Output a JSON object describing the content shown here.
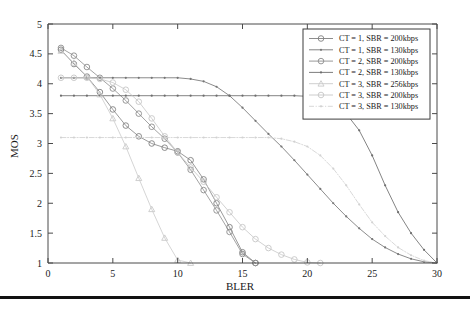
{
  "chart_data": {
    "type": "line",
    "title": "",
    "xlabel": "BLER",
    "ylabel": "MOS",
    "xlim": [
      0,
      30
    ],
    "ylim": [
      1,
      5
    ],
    "xticks": [
      0,
      5,
      10,
      15,
      20,
      25,
      30
    ],
    "xtick_labels": [
      "0",
      "5",
      "10",
      "15",
      "20",
      "25",
      "30"
    ],
    "yticks": [
      1,
      1.5,
      2,
      2.5,
      3,
      3.5,
      4,
      4.5,
      5
    ],
    "ytick_labels": [
      "1",
      "1.5",
      "2",
      "2.5",
      "3",
      "3.5",
      "4",
      "4.5",
      "5"
    ],
    "grid": false,
    "legend_position": "upper right",
    "series": [
      {
        "name": "CT = 1, SBR = 200kbps",
        "color": "#808080",
        "marker": "circle",
        "linestyle": "solid",
        "x": [
          1,
          2,
          3,
          4,
          5,
          6,
          7,
          8,
          9,
          10,
          11,
          12,
          13,
          14,
          15,
          16
        ],
        "y": [
          4.57,
          4.33,
          4.12,
          3.86,
          3.57,
          3.3,
          3.12,
          3.0,
          2.93,
          2.87,
          2.72,
          2.4,
          2.0,
          1.6,
          1.18,
          1.0
        ]
      },
      {
        "name": "CT = 1, SBR = 130kbps",
        "color": "#767676",
        "marker": "dot",
        "linestyle": "solid",
        "x": [
          1,
          2,
          3,
          4,
          5,
          6,
          7,
          8,
          9,
          10,
          11,
          12,
          13,
          14,
          15,
          16,
          17,
          18,
          19,
          20,
          21,
          22,
          23,
          24,
          25,
          26,
          27,
          28,
          29,
          30
        ],
        "y": [
          4.1,
          4.1,
          4.1,
          4.1,
          4.1,
          4.1,
          4.1,
          4.1,
          4.1,
          4.1,
          4.08,
          4.04,
          3.95,
          3.8,
          3.6,
          3.38,
          3.16,
          2.95,
          2.72,
          2.48,
          2.24,
          2.0,
          1.78,
          1.58,
          1.4,
          1.26,
          1.15,
          1.07,
          1.02,
          1.0
        ]
      },
      {
        "name": "CT = 2, SBR = 200kbps",
        "color": "#8c8c8c",
        "marker": "circle",
        "linestyle": "solid",
        "x": [
          1,
          2,
          3,
          4,
          5,
          6,
          7,
          8,
          9,
          10,
          11,
          12,
          13,
          14,
          15,
          16
        ],
        "y": [
          4.6,
          4.47,
          4.28,
          4.1,
          3.92,
          3.72,
          3.5,
          3.28,
          3.08,
          2.85,
          2.56,
          2.22,
          1.88,
          1.52,
          1.15,
          1.0
        ]
      },
      {
        "name": "CT = 2, SBR = 130kbps",
        "color": "#6e6e6e",
        "marker": "dot",
        "linestyle": "solid",
        "x": [
          1,
          2,
          3,
          4,
          5,
          6,
          7,
          8,
          9,
          10,
          11,
          12,
          13,
          14,
          15,
          16,
          17,
          18,
          19,
          20,
          21,
          22,
          23,
          24,
          25,
          26,
          27,
          28,
          29,
          30
        ],
        "y": [
          3.8,
          3.8,
          3.8,
          3.8,
          3.8,
          3.8,
          3.8,
          3.8,
          3.8,
          3.8,
          3.8,
          3.8,
          3.8,
          3.8,
          3.8,
          3.8,
          3.8,
          3.8,
          3.8,
          3.79,
          3.75,
          3.66,
          3.5,
          3.22,
          2.8,
          2.3,
          1.85,
          1.5,
          1.22,
          1.0
        ]
      },
      {
        "name": "CT = 3, SBR = 256kbps",
        "color": "#cacaca",
        "marker": "triangle",
        "linestyle": "solid",
        "x": [
          1,
          2,
          3,
          4,
          5,
          6,
          7,
          8,
          9,
          10,
          11
        ],
        "y": [
          4.55,
          4.35,
          4.12,
          3.82,
          3.42,
          2.95,
          2.42,
          1.9,
          1.42,
          1.05,
          1.0
        ]
      },
      {
        "name": "CT = 3, SBR = 200kbps",
        "color": "#c6c6c6",
        "marker": "circle",
        "linestyle": "solid",
        "x": [
          1,
          2,
          3,
          4,
          5,
          6,
          7,
          8,
          9,
          10,
          11,
          12,
          13,
          14,
          15,
          16,
          17,
          18,
          19,
          20,
          21
        ],
        "y": [
          4.1,
          4.1,
          4.1,
          4.08,
          4.02,
          3.9,
          3.7,
          3.42,
          3.12,
          2.85,
          2.6,
          2.36,
          2.1,
          1.85,
          1.6,
          1.4,
          1.25,
          1.14,
          1.06,
          1.01,
          1.0
        ]
      },
      {
        "name": "CT = 3, SBR = 130kbps",
        "color": "#d2d2d2",
        "marker": "dot",
        "linestyle": "dashdot",
        "x": [
          1,
          2,
          3,
          4,
          5,
          6,
          7,
          8,
          9,
          10,
          11,
          12,
          13,
          14,
          15,
          16,
          17,
          18,
          19,
          20,
          21,
          22,
          23,
          24,
          25,
          26,
          27,
          28,
          29,
          30
        ],
        "y": [
          3.1,
          3.1,
          3.1,
          3.1,
          3.1,
          3.1,
          3.1,
          3.1,
          3.1,
          3.1,
          3.1,
          3.1,
          3.1,
          3.1,
          3.1,
          3.1,
          3.1,
          3.08,
          3.03,
          2.95,
          2.8,
          2.58,
          2.3,
          1.98,
          1.68,
          1.45,
          1.26,
          1.13,
          1.04,
          1.0
        ]
      }
    ]
  }
}
